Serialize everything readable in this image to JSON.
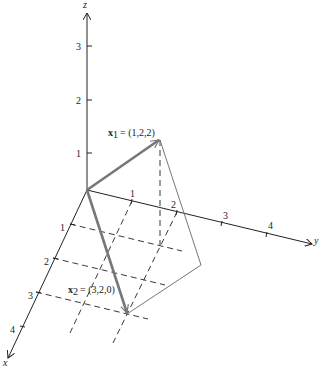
{
  "figure": {
    "type": "3d-vector-diagram",
    "axes": {
      "x": {
        "label": "x",
        "ticks": [
          "1",
          "2",
          "3",
          "4"
        ]
      },
      "y": {
        "label": "y",
        "ticks": [
          "1",
          "2",
          "3",
          "4"
        ]
      },
      "z": {
        "label": "z",
        "ticks": [
          "1",
          "2",
          "3"
        ]
      }
    },
    "vectors": [
      {
        "name": "x1",
        "symbol": "x",
        "subscript": "1",
        "value": "= (1,2,2)",
        "coords": [
          1,
          2,
          2
        ]
      },
      {
        "name": "x2",
        "symbol": "x",
        "subscript": "2",
        "value": "= (3,2,0)",
        "coords": [
          3,
          2,
          0
        ]
      }
    ],
    "colors": {
      "axis": "#222222",
      "vector": "#777777",
      "background": "#ffffff"
    }
  }
}
